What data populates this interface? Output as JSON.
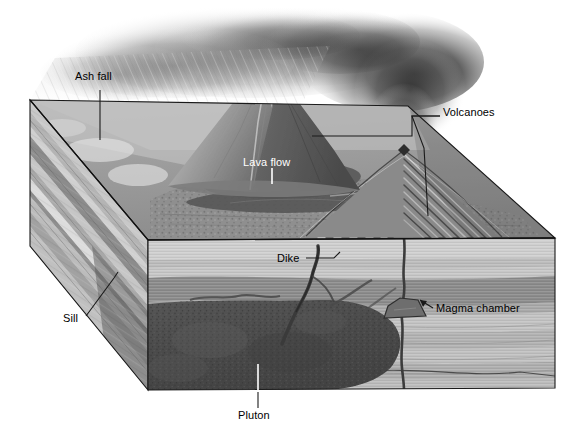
{
  "figure": {
    "kind": "geologic-block-diagram",
    "palette": {
      "background": "#ffffff",
      "label_text": "#000000",
      "label_text_light": "#ffffff",
      "leader_line": "#1a1a1a",
      "leader_line_light": "#ffffff",
      "block_outline": "#1a1a1a",
      "top_surface": "#9a9a9a",
      "left_face": "#a8a8a8",
      "front_face": "#b0b0b0",
      "strata_light": "#c2c2c2",
      "strata_mid": "#a6a6a6",
      "strata_dark": "#8a8a8a",
      "pluton": "#4e4e4e",
      "dike": "#3a3a3a",
      "magma_chamber": "#6a6a6a",
      "lava_flow": "#5a5a5a",
      "ash_plume": "#2a2a2a",
      "ash_fall": "#bfbfbf"
    }
  },
  "labels": [
    {
      "id": "ash-fall",
      "text": "Ash fall",
      "color": "dark",
      "x": 75,
      "y": 76
    },
    {
      "id": "volcanoes",
      "text": "Volcanoes",
      "color": "dark",
      "x": 443,
      "y": 112
    },
    {
      "id": "lava-flow",
      "text": "Lava flow",
      "color": "light",
      "x": 243,
      "y": 162
    },
    {
      "id": "dike",
      "text": "Dike",
      "color": "dark",
      "x": 277,
      "y": 253
    },
    {
      "id": "magma-chamber",
      "text": "Magma chamber",
      "color": "dark",
      "x": 436,
      "y": 304
    },
    {
      "id": "sill",
      "text": "Sill",
      "color": "dark",
      "x": 63,
      "y": 318
    },
    {
      "id": "pluton",
      "text": "Pluton",
      "color": "dark",
      "x": 238,
      "y": 414
    }
  ],
  "features": [
    {
      "id": "volcano-main",
      "name": "Main composite volcano with summit crater"
    },
    {
      "id": "volcano-second",
      "name": "Second volcano shown in cross section with folded layers"
    },
    {
      "id": "lava-flow-body",
      "name": "Dark lava flow spreading across the land surface"
    },
    {
      "id": "ash-plume",
      "name": "Dark eruption ash plume drifting left"
    },
    {
      "id": "ash-fall-streaks",
      "name": "Diagonal ash fall streaks settling onto the surface"
    },
    {
      "id": "pluton-body",
      "name": "Large dark mottled pluton in the lower crust"
    },
    {
      "id": "dike-body",
      "name": "Near vertical dike cutting the strata"
    },
    {
      "id": "sill-body",
      "name": "Sheet intrusion concordant with bedding on the left face"
    },
    {
      "id": "magma-chamber-body",
      "name": "Small trapezoidal magma chamber feeding the conduit"
    },
    {
      "id": "conduit",
      "name": "Vertical feeder conduit rising to the second volcano"
    },
    {
      "id": "strata",
      "name": "Layered sedimentary strata on the cut faces"
    }
  ]
}
